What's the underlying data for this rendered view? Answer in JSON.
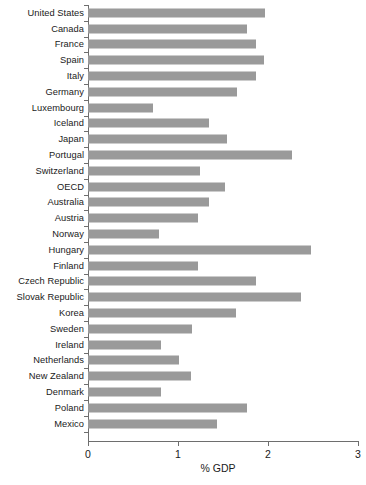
{
  "chart_data": {
    "type": "bar",
    "orientation": "horizontal",
    "title": "",
    "xlabel": "% GDP",
    "ylabel": "",
    "xlim": [
      0,
      3
    ],
    "xticks": [
      0,
      1,
      2,
      3
    ],
    "xtick_labels": [
      "0",
      "1",
      "2",
      "3"
    ],
    "grid": false,
    "legend": false,
    "bar_color": "#9a9a9a",
    "axis_color": "#6e6e6e",
    "text_color": "#1a1a1a",
    "categories": [
      "United States",
      "Canada",
      "France",
      "Spain",
      "Italy",
      "Germany",
      "Luxembourg",
      "Iceland",
      "Japan",
      "Portugal",
      "Switzerland",
      "OECD",
      "Australia",
      "Austria",
      "Norway",
      "Hungary",
      "Finland",
      "Czech Republic",
      "Slovak Republic",
      "Korea",
      "Sweden",
      "Ireland",
      "Netherlands",
      "New Zealand",
      "Denmark",
      "Poland",
      "Mexico"
    ],
    "values": [
      1.97,
      1.77,
      1.87,
      1.96,
      1.87,
      1.66,
      0.72,
      1.34,
      1.54,
      2.27,
      1.24,
      1.52,
      1.34,
      1.22,
      0.79,
      2.48,
      1.22,
      1.87,
      2.37,
      1.64,
      1.15,
      0.81,
      1.01,
      1.14,
      0.81,
      1.77,
      1.43
    ]
  }
}
